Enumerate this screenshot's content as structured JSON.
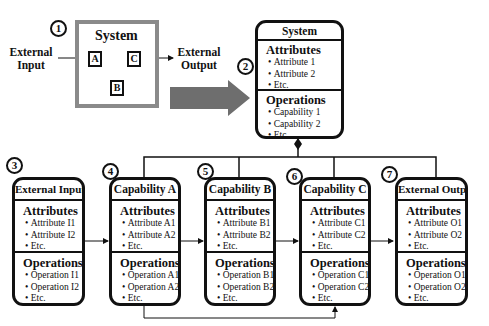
{
  "panel1": {
    "number": "1",
    "system_title": "System",
    "external_input": [
      "External",
      "Input"
    ],
    "external_output": [
      "External",
      "Output"
    ],
    "blocks": [
      "A",
      "B",
      "C"
    ]
  },
  "system_class": {
    "number": "2",
    "title": "System",
    "attributes_title": "Attributes",
    "attributes": [
      "Attribute 1",
      "Attribute 2",
      "Etc."
    ],
    "operations_title": "Operations",
    "operations": [
      "Capability 1",
      "Capability 2",
      "Etc."
    ]
  },
  "classes": [
    {
      "number": "3",
      "title": "External Input",
      "attributes_title": "Attributes",
      "attributes": [
        "Attribute I1",
        "Attribute I2",
        "Etc."
      ],
      "operations_title": "Operations",
      "operations": [
        "Operation I1",
        "Operation I2",
        "Etc."
      ]
    },
    {
      "number": "4",
      "title": "Capability A",
      "attributes_title": "Attributes",
      "attributes": [
        "Attribute A1",
        "Attribute A2",
        "Etc."
      ],
      "operations_title": "Operations",
      "operations": [
        "Operation A1",
        "Operation A2",
        "Etc."
      ]
    },
    {
      "number": "5",
      "title": "Capability B",
      "attributes_title": "Attributes",
      "attributes": [
        "Attribute B1",
        "Attribute B2",
        "Etc."
      ],
      "operations_title": "Operations",
      "operations": [
        "Operation B1",
        "Operation B2",
        "Etc."
      ]
    },
    {
      "number": "6",
      "title": "Capability C",
      "attributes_title": "Attributes",
      "attributes": [
        "Attribute C1",
        "Attribute C2",
        "Etc."
      ],
      "operations_title": "Operations",
      "operations": [
        "Operation C1",
        "Operation C2",
        "Etc."
      ]
    },
    {
      "number": "7",
      "title": "External Output",
      "attributes_title": "Attributes",
      "attributes": [
        "Attribute O1",
        "Attribute O2",
        "Etc."
      ],
      "operations_title": "Operations",
      "operations": [
        "Operation O1",
        "Operation O2",
        "Etc."
      ]
    }
  ],
  "colors": {
    "line": "#111111",
    "system_border": "#8a8a8a",
    "big_arrow": "#6e6e6e"
  }
}
